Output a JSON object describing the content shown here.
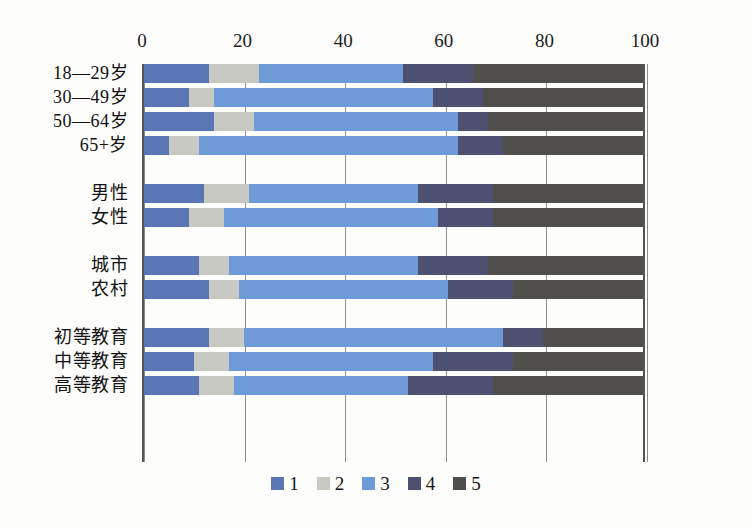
{
  "chart_data": {
    "type": "bar",
    "orientation": "horizontal",
    "stacked": true,
    "title": "",
    "subtitle": "",
    "xlabel": "",
    "ylabel": "",
    "xlim": [
      0,
      100
    ],
    "xticks": [
      0,
      20,
      40,
      60,
      80,
      100
    ],
    "grid": true,
    "legend_position": "bottom",
    "categories": [
      "18—29岁",
      "30—49岁",
      "50—64岁",
      "65+岁",
      "男性",
      "女性",
      "城市",
      "农村",
      "初等教育",
      "中等教育",
      "高等教育"
    ],
    "group_breaks_after": [
      "65+岁",
      "女性",
      "农村"
    ],
    "series": [
      {
        "name": "1",
        "color": "#5b76b5",
        "values": [
          13,
          9,
          14,
          5,
          12,
          9,
          11,
          13,
          13,
          10,
          11
        ]
      },
      {
        "name": "2",
        "color": "#c9c9c4",
        "values": [
          10,
          5,
          8,
          6,
          9,
          7,
          6,
          6,
          7,
          7,
          7
        ]
      },
      {
        "name": "3",
        "color": "#6f9ad8",
        "values": [
          29,
          44,
          41,
          52,
          34,
          43,
          38,
          42,
          52,
          41,
          35
        ]
      },
      {
        "name": "4",
        "color": "#4d5071",
        "values": [
          14,
          10,
          6,
          9,
          15,
          11,
          14,
          13,
          8,
          16,
          17
        ]
      },
      {
        "name": "5",
        "color": "#504f4c",
        "values": [
          34,
          32,
          31,
          28,
          30,
          30,
          31,
          26,
          20,
          26,
          30
        ]
      }
    ],
    "legend": [
      {
        "label": "1",
        "color": "#5b76b5"
      },
      {
        "label": "2",
        "color": "#c9c9c4"
      },
      {
        "label": "3",
        "color": "#6f9ad8"
      },
      {
        "label": "4",
        "color": "#4d5071"
      },
      {
        "label": "5",
        "color": "#504f4c"
      }
    ]
  },
  "axis": {
    "ticks": [
      "0",
      "20",
      "40",
      "60",
      "80",
      "100"
    ]
  }
}
